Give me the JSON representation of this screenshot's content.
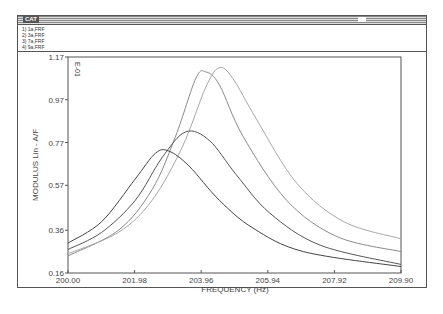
{
  "window": {
    "title": "CAT"
  },
  "legend": [
    "1) 1a,FRF",
    "2) 3a,FRF",
    "3) 7a,FRF",
    "4) 9a,FRF"
  ],
  "chart_data": {
    "type": "line",
    "title": "",
    "xlabel": "FREQUENCY (Hz)",
    "ylabel": "MODULUS Lin - A/F",
    "y_scale_note": "E-01",
    "xlim": [
      200.0,
      209.9
    ],
    "ylim": [
      0.16,
      1.17
    ],
    "x_ticks": [
      "200.00",
      "201.98",
      "203.96",
      "205.94",
      "207.92",
      "209.90"
    ],
    "y_ticks": [
      "1.17",
      "0.97",
      "0.77",
      "0.57",
      "0.36",
      "0.16"
    ],
    "grid": false,
    "series": [
      {
        "name": "1) 1a,FRF",
        "x": [
          200.0,
          201.5,
          202.5,
          203.2,
          203.8,
          204.1,
          204.5,
          205.2,
          206.5,
          208.0,
          209.9
        ],
        "y": [
          0.24,
          0.36,
          0.55,
          0.8,
          1.07,
          1.1,
          1.04,
          0.8,
          0.5,
          0.33,
          0.26
        ]
      },
      {
        "name": "2) 3a,FRF",
        "x": [
          200.0,
          201.5,
          202.5,
          203.4,
          204.1,
          204.5,
          204.9,
          205.6,
          206.8,
          208.2,
          209.9
        ],
        "y": [
          0.25,
          0.35,
          0.5,
          0.75,
          1.03,
          1.12,
          1.07,
          0.88,
          0.58,
          0.4,
          0.32
        ]
      },
      {
        "name": "3) 7a,FRF",
        "x": [
          200.0,
          201.0,
          202.0,
          202.8,
          203.5,
          204.2,
          205.0,
          206.0,
          207.5,
          209.9
        ],
        "y": [
          0.27,
          0.35,
          0.5,
          0.7,
          0.82,
          0.78,
          0.62,
          0.44,
          0.29,
          0.2
        ]
      },
      {
        "name": "4) 9a,FRF",
        "x": [
          200.0,
          201.0,
          202.0,
          202.6,
          203.0,
          203.6,
          204.5,
          205.5,
          207.0,
          209.9
        ],
        "y": [
          0.3,
          0.4,
          0.6,
          0.72,
          0.73,
          0.66,
          0.5,
          0.37,
          0.26,
          0.19
        ]
      }
    ]
  }
}
